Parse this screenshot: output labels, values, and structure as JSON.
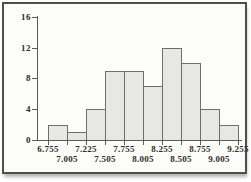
{
  "chart_data": {
    "type": "bar",
    "subtype": "histogram",
    "title": "",
    "xlabel": "",
    "ylabel": "",
    "bin_edges": [
      6.755,
      7.005,
      7.225,
      7.505,
      7.755,
      8.005,
      8.255,
      8.505,
      8.755,
      9.005,
      9.255
    ],
    "bin_edge_labels": [
      "6.755",
      "7.005",
      "7.225",
      "7.505",
      "7.755",
      "8.005",
      "8.255",
      "8.505",
      "8.755",
      "9.005",
      "9.255"
    ],
    "values": [
      2,
      1,
      4,
      9,
      9,
      7,
      12,
      10,
      4,
      2
    ],
    "ylim": [
      0,
      16
    ],
    "y_ticks": [
      0,
      4,
      8,
      12,
      16
    ],
    "y_tick_labels": [
      "0",
      "4",
      "8",
      "12",
      "16"
    ],
    "grid": false,
    "legend": false,
    "x_label_layout": "staggered-two-rows",
    "colors": {
      "bar_fill": "#e7e7e3",
      "bar_border": "#6e6e6a",
      "axis": "#5a5a56",
      "text": "#2e2c28",
      "frame_border": "#4e4e4a",
      "plot_background": "#fcfcf9"
    }
  }
}
